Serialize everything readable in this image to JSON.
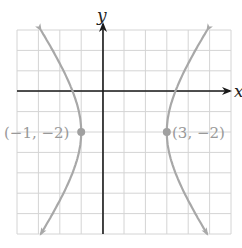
{
  "figure": {
    "type": "hyperbola-graph",
    "axis_labels": {
      "x": "x",
      "y": "y"
    },
    "grid": {
      "x_min": -4,
      "x_max": 6,
      "y_min": -7,
      "y_max": 3,
      "step": 1
    },
    "curve": {
      "description": "Horizontal hyperbola with center (1, -2), a = 2, b = 3",
      "center": [
        1,
        -2
      ],
      "a": 2,
      "b": 3,
      "color": "#a8a8a8"
    },
    "points": [
      {
        "label": "(−1, −2)",
        "x": -1,
        "y": -2
      },
      {
        "label": "(3, −2)",
        "x": 3,
        "y": -2
      }
    ],
    "colors": {
      "grid": "#d4d4d4",
      "axis": "#1a1a1a",
      "curve": "#a8a8a8",
      "point": "#a0a0a0",
      "point_label": "#999999"
    }
  }
}
